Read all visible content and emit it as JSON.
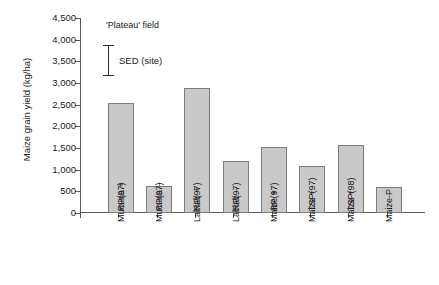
{
  "chart_data": {
    "type": "bar",
    "title": "",
    "annotation": "'Plateau' field",
    "xlabel": "",
    "ylabel": "Maize grain yield (kg/ha)",
    "ylim": [
      0,
      4500
    ],
    "ytick_step": 500,
    "ytick_labels": [
      "0",
      "500",
      "1,000",
      "1,500",
      "2,000",
      "2,500",
      "3,000",
      "3,500",
      "4,000",
      "4,500"
    ],
    "ytick_values": [
      0,
      500,
      1000,
      1500,
      2000,
      2500,
      3000,
      3500,
      4000,
      4500
    ],
    "grid": false,
    "legend": "none",
    "categories": [
      "Mucuna + RP(97)",
      "Mucuna – RP(97)",
      "Lablab + RP(97)",
      "Lablab – RP(97)",
      "Maize + RP(97)",
      "Maize + TSP(97)",
      "Maize + TSP(98)",
      "Maize-P"
    ],
    "category_lines": [
      [
        "Mucuna +",
        "RP(97)"
      ],
      [
        "Mucuna –",
        "RP(97)"
      ],
      [
        "Lablab +",
        "RP(97)"
      ],
      [
        "Lablab –",
        "RP(97)"
      ],
      [
        "Maize +",
        "RP(97)"
      ],
      [
        "Maize +",
        "TSP(97)"
      ],
      [
        "Maize +",
        "TSP(98)"
      ],
      [
        "Maize-P"
      ]
    ],
    "values": [
      2540,
      620,
      2890,
      1200,
      1520,
      1080,
      1580,
      600
    ],
    "bar_color": "#c9c9c9",
    "bar_border_color": "#7d7d7d",
    "axis_color": "#5a5a5a",
    "error_marker": {
      "label": "SED  (site)",
      "upper": 3880,
      "lower": 3190
    }
  }
}
